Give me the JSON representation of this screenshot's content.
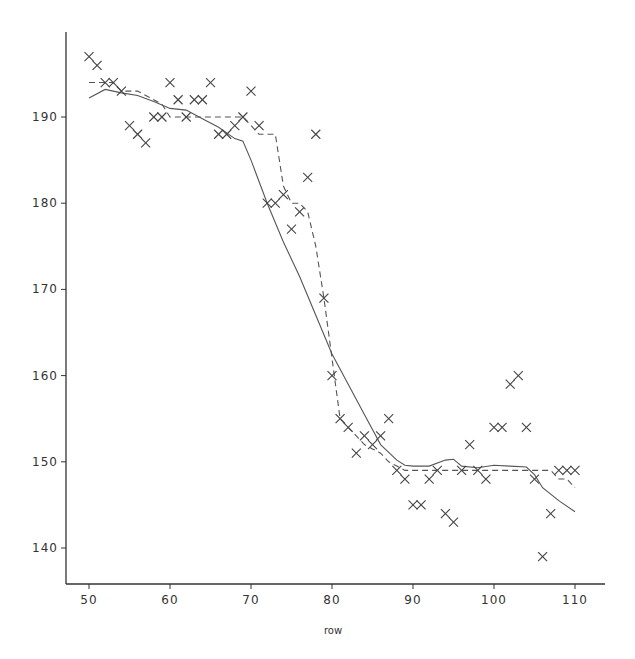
{
  "chart_data": {
    "type": "scatter",
    "title": "",
    "xlabel": "row",
    "ylabel": "",
    "xlim": [
      48.5,
      112.5
    ],
    "ylim": [
      135.8,
      199.7
    ],
    "x_ticks": [
      50,
      60,
      70,
      80,
      90,
      100,
      110
    ],
    "y_ticks": [
      140,
      150,
      160,
      170,
      180,
      190
    ],
    "grid": false,
    "legend": null,
    "colors": {
      "axis": "#333333",
      "points": "#444444",
      "smooth": "#555555",
      "step": "#555555"
    },
    "series": [
      {
        "name": "observed",
        "kind": "scatter",
        "marker": "x",
        "x": [
          50,
          51,
          52,
          53,
          54,
          55,
          56,
          57,
          58,
          59,
          60,
          61,
          62,
          63,
          64,
          65,
          66,
          67,
          68,
          69,
          70,
          71,
          72,
          73,
          74,
          75,
          76,
          77,
          78,
          79,
          80,
          81,
          82,
          83,
          84,
          85,
          86,
          87,
          88,
          89,
          90,
          91,
          92,
          93,
          94,
          95,
          96,
          97,
          98,
          99,
          100,
          101,
          102,
          103,
          104,
          105,
          106,
          107,
          108,
          109,
          110
        ],
        "y": [
          197,
          196,
          194,
          194,
          193,
          189,
          188,
          187,
          190,
          190,
          194,
          192,
          190,
          192,
          192,
          194,
          188,
          188,
          189,
          190,
          193,
          189,
          180,
          180,
          181,
          177,
          179,
          183,
          188,
          169,
          160,
          155,
          154,
          151,
          153,
          152,
          153,
          155,
          149,
          148,
          145,
          145,
          148,
          149,
          144,
          143,
          149,
          152,
          149,
          148,
          154,
          154,
          159,
          160,
          154,
          148,
          139,
          144,
          149,
          149,
          149
        ]
      },
      {
        "name": "smooth fit",
        "kind": "line",
        "style": "solid",
        "x": [
          50,
          52,
          54,
          56,
          58,
          60,
          62,
          64,
          66,
          68,
          69,
          70,
          72,
          74,
          76,
          78,
          80,
          82,
          84,
          86,
          88,
          89,
          90,
          92,
          94,
          95,
          96,
          98,
          100,
          102,
          104,
          105,
          106,
          108,
          110
        ],
        "y": [
          192.2,
          193.2,
          192.8,
          192.5,
          191.8,
          191,
          190.8,
          189.8,
          188.8,
          187.5,
          187.2,
          185,
          180,
          175.5,
          171.5,
          167,
          162.5,
          159,
          155.5,
          152,
          150.2,
          149.6,
          149.5,
          149.5,
          150.2,
          150.3,
          149.5,
          149.3,
          149.6,
          149.5,
          149.4,
          148.5,
          147,
          145.5,
          144.2
        ]
      },
      {
        "name": "step fit",
        "kind": "line",
        "style": "dashed",
        "x": [
          50,
          53,
          54,
          56,
          58,
          59,
          60,
          62,
          64,
          66,
          68,
          69,
          70,
          71,
          72,
          73,
          74,
          75,
          76,
          77,
          78,
          79,
          80,
          81,
          82,
          83,
          84,
          85,
          86,
          87,
          88,
          89,
          90,
          95,
          100,
          105,
          107,
          108,
          109,
          110
        ],
        "y": [
          194,
          194,
          193,
          193,
          192,
          191.5,
          190,
          190,
          190,
          190,
          190,
          190,
          189,
          188,
          188,
          188,
          182,
          180,
          180,
          179,
          175,
          169,
          162,
          155,
          154,
          153,
          152,
          151.5,
          151,
          150,
          149.5,
          149,
          149,
          149,
          149,
          149,
          149,
          148,
          148,
          147
        ]
      }
    ]
  }
}
